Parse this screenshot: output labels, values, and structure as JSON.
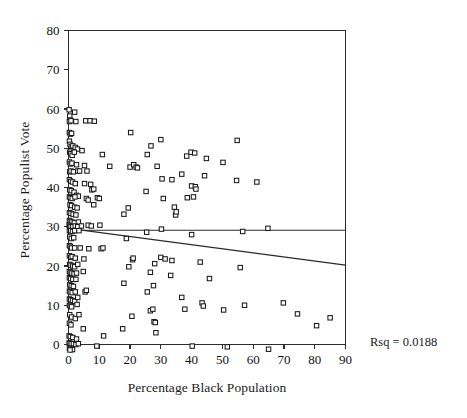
{
  "figure": {
    "background": "#ffffff",
    "ink_color": "#2b2b2b"
  },
  "annotation": {
    "rsq_label": "Rsq = 0.0188"
  },
  "chart_data": {
    "type": "scatter",
    "title": "",
    "subtitle": "",
    "xlabel": "Percentage Black Population",
    "ylabel": "Percentage Populist Vote",
    "xlim": [
      0,
      90
    ],
    "ylim": [
      0,
      80
    ],
    "xticks": [
      0,
      10,
      20,
      30,
      40,
      50,
      60,
      70,
      80,
      90
    ],
    "yticks": [
      0,
      10,
      20,
      30,
      40,
      50,
      60,
      70,
      80
    ],
    "xtick_labels": [
      "0",
      "10",
      "20",
      "30",
      "40",
      "50",
      "60",
      "70",
      "80",
      "90"
    ],
    "ytick_labels": [
      "0",
      "10",
      "20",
      "30",
      "40",
      "50",
      "60",
      "70",
      "80"
    ],
    "grid": false,
    "legend": null,
    "legend_position": "none",
    "marker": {
      "shape": "square",
      "filled": false,
      "size_px": 4.4,
      "edge_color": "#1a1a1a",
      "face_color": "#ffffff"
    },
    "annotations": [
      {
        "text": "Rsq = 0.0188",
        "x": 96,
        "y": 1,
        "coordinate_space": "data-right-margin"
      }
    ],
    "lines": [
      {
        "name": "mean-reference-line",
        "style": "solid",
        "x": [
          0,
          90
        ],
        "y": [
          29.1,
          29.1
        ]
      },
      {
        "name": "regression-line",
        "style": "solid",
        "x": [
          0,
          90
        ],
        "y": [
          29.6,
          20.2
        ]
      }
    ],
    "series": [
      {
        "name": "counties",
        "points": [
          [
            0.2,
            59.8
          ],
          [
            0.4,
            58.2
          ],
          [
            0.5,
            57.2
          ],
          [
            0.3,
            56.8
          ],
          [
            0.8,
            57.0
          ],
          [
            2.0,
            59.2
          ],
          [
            2.4,
            56.8
          ],
          [
            5.6,
            57.0
          ],
          [
            7.0,
            57.0
          ],
          [
            8.4,
            56.9
          ],
          [
            0.3,
            54.0
          ],
          [
            0.6,
            53.6
          ],
          [
            1.0,
            53.8
          ],
          [
            20.2,
            54.0
          ],
          [
            0.3,
            51.8
          ],
          [
            0.5,
            51.0
          ],
          [
            0.9,
            50.5
          ],
          [
            1.4,
            50.6
          ],
          [
            2.2,
            50.2
          ],
          [
            2.9,
            49.8
          ],
          [
            4.4,
            49.4
          ],
          [
            26.8,
            50.6
          ],
          [
            30.0,
            52.2
          ],
          [
            54.8,
            52.0
          ],
          [
            0.4,
            49.0
          ],
          [
            0.7,
            48.6
          ],
          [
            1.2,
            48.2
          ],
          [
            1.9,
            49.0
          ],
          [
            11.0,
            48.4
          ],
          [
            25.6,
            48.4
          ],
          [
            38.4,
            48.0
          ],
          [
            39.8,
            49.0
          ],
          [
            41.0,
            48.8
          ],
          [
            44.8,
            47.4
          ],
          [
            0.3,
            46.5
          ],
          [
            0.6,
            46.0
          ],
          [
            1.1,
            46.2
          ],
          [
            2.6,
            45.8
          ],
          [
            5.2,
            45.6
          ],
          [
            13.4,
            45.4
          ],
          [
            20.0,
            45.2
          ],
          [
            21.2,
            45.8
          ],
          [
            22.0,
            45.2
          ],
          [
            22.4,
            45.0
          ],
          [
            28.8,
            45.4
          ],
          [
            50.2,
            46.4
          ],
          [
            0.4,
            44.0
          ],
          [
            0.8,
            44.2
          ],
          [
            1.6,
            44.0
          ],
          [
            3.0,
            44.2
          ],
          [
            3.6,
            44.2
          ],
          [
            6.0,
            44.2
          ],
          [
            30.4,
            42.2
          ],
          [
            33.6,
            42.0
          ],
          [
            36.8,
            43.4
          ],
          [
            44.2,
            43.0
          ],
          [
            0.3,
            42.0
          ],
          [
            0.7,
            41.6
          ],
          [
            1.3,
            41.4
          ],
          [
            2.2,
            41.0
          ],
          [
            5.2,
            41.0
          ],
          [
            7.2,
            40.8
          ],
          [
            40.0,
            40.4
          ],
          [
            41.2,
            40.2
          ],
          [
            41.4,
            39.6
          ],
          [
            54.6,
            41.8
          ],
          [
            61.2,
            41.4
          ],
          [
            0.4,
            39.4
          ],
          [
            0.9,
            39.2
          ],
          [
            1.8,
            38.8
          ],
          [
            2.6,
            38.0
          ],
          [
            3.2,
            37.8
          ],
          [
            7.6,
            39.4
          ],
          [
            8.2,
            39.6
          ],
          [
            25.2,
            39.0
          ],
          [
            0.3,
            37.6
          ],
          [
            0.6,
            37.4
          ],
          [
            1.2,
            37.2
          ],
          [
            2.1,
            37.6
          ],
          [
            5.8,
            37.2
          ],
          [
            6.4,
            36.8
          ],
          [
            9.4,
            37.4
          ],
          [
            10.0,
            37.2
          ],
          [
            30.8,
            37.2
          ],
          [
            38.6,
            37.4
          ],
          [
            40.6,
            37.6
          ],
          [
            0.5,
            35.6
          ],
          [
            1.0,
            35.4
          ],
          [
            2.0,
            35.0
          ],
          [
            2.8,
            34.8
          ],
          [
            8.2,
            35.6
          ],
          [
            19.4,
            34.8
          ],
          [
            34.4,
            35.0
          ],
          [
            0.3,
            33.6
          ],
          [
            0.8,
            33.4
          ],
          [
            1.5,
            33.2
          ],
          [
            2.4,
            33.0
          ],
          [
            18.0,
            33.2
          ],
          [
            34.8,
            33.0
          ],
          [
            35.0,
            33.8
          ],
          [
            0.3,
            31.6
          ],
          [
            0.6,
            31.4
          ],
          [
            1.1,
            31.2
          ],
          [
            1.9,
            31.0
          ],
          [
            3.2,
            31.2
          ],
          [
            0.2,
            30.4
          ],
          [
            0.4,
            30.2
          ],
          [
            0.8,
            30.0
          ],
          [
            1.4,
            30.0
          ],
          [
            2.2,
            30.2
          ],
          [
            3.0,
            30.0
          ],
          [
            4.2,
            30.2
          ],
          [
            6.4,
            30.4
          ],
          [
            7.4,
            30.2
          ],
          [
            10.2,
            30.4
          ],
          [
            0.3,
            29.0
          ],
          [
            0.7,
            29.0
          ],
          [
            1.3,
            28.8
          ],
          [
            2.0,
            29.0
          ],
          [
            3.4,
            29.0
          ],
          [
            25.4,
            28.6
          ],
          [
            30.2,
            29.4
          ],
          [
            56.6,
            28.8
          ],
          [
            64.8,
            29.6
          ],
          [
            0.4,
            27.4
          ],
          [
            0.9,
            27.0
          ],
          [
            1.7,
            27.2
          ],
          [
            18.8,
            27.0
          ],
          [
            40.0,
            28.0
          ],
          [
            0.3,
            25.2
          ],
          [
            0.6,
            25.0
          ],
          [
            1.0,
            24.6
          ],
          [
            2.0,
            24.6
          ],
          [
            3.8,
            24.6
          ],
          [
            6.6,
            24.4
          ],
          [
            10.6,
            24.4
          ],
          [
            11.2,
            24.6
          ],
          [
            0.3,
            22.6
          ],
          [
            0.7,
            22.2
          ],
          [
            1.2,
            22.4
          ],
          [
            2.2,
            22.0
          ],
          [
            5.0,
            21.8
          ],
          [
            20.8,
            21.6
          ],
          [
            21.0,
            22.0
          ],
          [
            30.0,
            22.2
          ],
          [
            31.4,
            21.8
          ],
          [
            33.6,
            21.4
          ],
          [
            42.8,
            21.0
          ],
          [
            0.4,
            20.4
          ],
          [
            0.8,
            20.2
          ],
          [
            1.4,
            20.0
          ],
          [
            2.0,
            19.8
          ],
          [
            3.0,
            20.4
          ],
          [
            19.6,
            19.8
          ],
          [
            28.0,
            20.6
          ],
          [
            55.8,
            19.6
          ],
          [
            0.3,
            18.6
          ],
          [
            0.6,
            18.4
          ],
          [
            1.1,
            18.2
          ],
          [
            1.8,
            18.0
          ],
          [
            2.6,
            18.2
          ],
          [
            4.8,
            18.6
          ],
          [
            26.6,
            18.4
          ],
          [
            33.2,
            17.6
          ],
          [
            0.3,
            17.0
          ],
          [
            0.7,
            16.8
          ],
          [
            1.4,
            16.6
          ],
          [
            2.4,
            16.6
          ],
          [
            45.8,
            16.8
          ],
          [
            0.4,
            15.2
          ],
          [
            0.9,
            15.0
          ],
          [
            1.6,
            14.8
          ],
          [
            18.0,
            15.6
          ],
          [
            27.6,
            15.0
          ],
          [
            0.3,
            13.6
          ],
          [
            0.6,
            13.4
          ],
          [
            1.2,
            13.2
          ],
          [
            2.2,
            13.4
          ],
          [
            5.4,
            13.4
          ],
          [
            5.8,
            13.8
          ],
          [
            25.6,
            13.4
          ],
          [
            0.3,
            11.6
          ],
          [
            0.7,
            11.4
          ],
          [
            1.3,
            11.2
          ],
          [
            2.0,
            11.0
          ],
          [
            3.0,
            12.0
          ],
          [
            36.8,
            12.0
          ],
          [
            43.4,
            10.6
          ],
          [
            57.2,
            10.0
          ],
          [
            69.8,
            10.6
          ],
          [
            0.3,
            10.0
          ],
          [
            0.6,
            9.8
          ],
          [
            1.0,
            9.6
          ],
          [
            2.8,
            10.2
          ],
          [
            26.6,
            8.6
          ],
          [
            27.4,
            9.0
          ],
          [
            37.8,
            9.0
          ],
          [
            43.8,
            9.8
          ],
          [
            50.4,
            8.8
          ],
          [
            0.4,
            7.6
          ],
          [
            1.0,
            7.0
          ],
          [
            2.2,
            6.6
          ],
          [
            3.4,
            7.6
          ],
          [
            20.6,
            7.2
          ],
          [
            27.8,
            5.8
          ],
          [
            28.2,
            5.6
          ],
          [
            74.4,
            7.8
          ],
          [
            85.0,
            6.8
          ],
          [
            0.3,
            5.4
          ],
          [
            0.8,
            5.0
          ],
          [
            4.8,
            4.0
          ],
          [
            17.6,
            4.0
          ],
          [
            28.4,
            3.0
          ],
          [
            80.6,
            4.8
          ],
          [
            0.2,
            2.2
          ],
          [
            0.6,
            2.0
          ],
          [
            1.4,
            1.8
          ],
          [
            2.6,
            1.4
          ],
          [
            11.4,
            2.2
          ],
          [
            0.2,
            0.4
          ],
          [
            0.5,
            0.3
          ],
          [
            0.9,
            0.2
          ],
          [
            1.6,
            0.2
          ],
          [
            2.4,
            0.0
          ],
          [
            3.2,
            0.2
          ],
          [
            9.2,
            -0.4
          ],
          [
            40.2,
            -0.4
          ],
          [
            51.6,
            -0.6
          ],
          [
            65.0,
            -1.2
          ],
          [
            0.3,
            -1.0
          ],
          [
            0.8,
            -1.2
          ],
          [
            1.3,
            -1.3
          ],
          [
            0.5,
            -1.4
          ]
        ]
      }
    ]
  }
}
